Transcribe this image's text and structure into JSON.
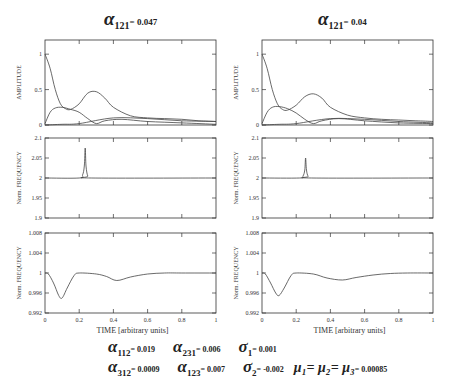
{
  "panels": [
    {
      "title": {
        "symbol": "α",
        "subscript": "121",
        "value": "= 0.047"
      },
      "left": 45
    },
    {
      "title": {
        "symbol": "α",
        "subscript": "121",
        "value": "= 0.04"
      },
      "left": 262
    }
  ],
  "axes_labels": {
    "amplitude": "AMPLITUDE",
    "frequency": "Norm. FREQUENCY",
    "time": "TIME [arbitrary units]"
  },
  "parameters": {
    "row1": [
      {
        "symbol": "α",
        "subscript": "112",
        "value": "= 0.019"
      },
      {
        "symbol": "α",
        "subscript": "231",
        "value": "= 0.006"
      },
      {
        "symbol": "σ",
        "subscript": "1",
        "value": "= 0.001"
      }
    ],
    "row2": [
      {
        "symbol": "α",
        "subscript": "312",
        "value": "= 0.0009"
      },
      {
        "symbol": "α",
        "subscript": "123",
        "value": "= 0.007"
      },
      {
        "symbol": "σ",
        "subscript": "2",
        "value": "= -0.002"
      },
      {
        "symbol": "μ₁= μ₂= μ₃",
        "subscript": "",
        "value": "= 0.00085"
      }
    ]
  },
  "chart_data": [
    {
      "type": "line",
      "panel": "left",
      "title": "α121 = 0.047",
      "xlabel": "",
      "ylabel": "AMPLITUDE",
      "xlim": [
        0,
        1
      ],
      "ylim": [
        0,
        1.2
      ],
      "yticks": [
        "0",
        "0.5",
        "1"
      ],
      "series": [
        {
          "name": "mode 1",
          "x": [
            0,
            0.03,
            0.06,
            0.09,
            0.12,
            0.15,
            0.2,
            0.25,
            0.3,
            0.35,
            0.4,
            0.5,
            0.6,
            0.7,
            0.8,
            0.9,
            1.0
          ],
          "values": [
            1.0,
            0.8,
            0.5,
            0.3,
            0.23,
            0.22,
            0.3,
            0.45,
            0.47,
            0.38,
            0.25,
            0.13,
            0.1,
            0.09,
            0.08,
            0.06,
            0.05
          ]
        },
        {
          "name": "mode 2",
          "x": [
            0,
            0.03,
            0.06,
            0.1,
            0.15,
            0.2,
            0.25,
            0.3,
            0.35,
            0.45,
            0.6,
            0.8,
            1.0
          ],
          "values": [
            0.02,
            0.18,
            0.24,
            0.25,
            0.22,
            0.18,
            0.09,
            0.02,
            0.06,
            0.08,
            0.05,
            0.03,
            0.01
          ]
        },
        {
          "name": "mode 3",
          "x": [
            0,
            0.1,
            0.2,
            0.4,
            0.6,
            0.8,
            1.0
          ],
          "values": [
            0.0,
            0.01,
            0.02,
            0.1,
            0.09,
            0.06,
            0.05
          ]
        }
      ]
    },
    {
      "type": "line",
      "panel": "left",
      "xlabel": "",
      "ylabel": "Norm. FREQUENCY",
      "xlim": [
        0,
        1
      ],
      "ylim": [
        1.9,
        2.1
      ],
      "yticks": [
        "1.9",
        "1.95",
        "2",
        "2.05",
        "2.1"
      ],
      "series": [
        {
          "name": "frequency",
          "x": [
            0,
            0.2,
            0.22,
            0.23,
            0.235,
            0.24,
            0.25,
            0.27,
            1.0
          ],
          "values": [
            2.0,
            2.0,
            2.008,
            2.03,
            2.075,
            2.03,
            2.005,
            2.0,
            2.0
          ]
        }
      ]
    },
    {
      "type": "line",
      "panel": "left",
      "xlabel": "TIME [arbitrary units]",
      "ylabel": "Norm. FREQUENCY",
      "xlim": [
        0,
        1
      ],
      "ylim": [
        0.992,
        1.008
      ],
      "xticks": [
        "0",
        "0.2",
        "0.4",
        "0.6",
        "0.8",
        "1"
      ],
      "yticks": [
        "0.992",
        "0.996",
        "1",
        "1.004",
        "1.008"
      ],
      "series": [
        {
          "name": "frequency",
          "x": [
            0,
            0.02,
            0.05,
            0.08,
            0.1,
            0.13,
            0.17,
            0.2,
            0.3,
            0.36,
            0.42,
            0.5,
            0.6,
            0.7,
            0.8,
            1.0
          ],
          "values": [
            1.0,
            0.9998,
            0.998,
            0.9955,
            0.995,
            0.997,
            0.9995,
            1.0,
            0.9998,
            0.9993,
            0.9985,
            0.9992,
            0.9998,
            1.0,
            1.0,
            1.0
          ]
        }
      ]
    },
    {
      "type": "line",
      "panel": "right",
      "title": "α121 = 0.04",
      "xlabel": "",
      "ylabel": "AMPLITUDE",
      "xlim": [
        0,
        1
      ],
      "ylim": [
        0,
        1.2
      ],
      "yticks": [
        "0",
        "0.5",
        "1"
      ],
      "series": [
        {
          "name": "mode 1",
          "x": [
            0,
            0.03,
            0.06,
            0.09,
            0.12,
            0.15,
            0.2,
            0.25,
            0.3,
            0.35,
            0.4,
            0.5,
            0.6,
            0.7,
            0.8,
            0.9,
            1.0
          ],
          "values": [
            1.0,
            0.8,
            0.5,
            0.3,
            0.22,
            0.21,
            0.28,
            0.4,
            0.44,
            0.38,
            0.25,
            0.14,
            0.1,
            0.08,
            0.07,
            0.06,
            0.05
          ]
        },
        {
          "name": "mode 2",
          "x": [
            0,
            0.03,
            0.06,
            0.1,
            0.15,
            0.2,
            0.25,
            0.3,
            0.35,
            0.45,
            0.6,
            0.8,
            1.0
          ],
          "values": [
            0.02,
            0.18,
            0.25,
            0.26,
            0.23,
            0.17,
            0.08,
            0.02,
            0.06,
            0.09,
            0.06,
            0.03,
            0.02
          ]
        },
        {
          "name": "mode 3",
          "x": [
            0,
            0.1,
            0.2,
            0.4,
            0.6,
            0.8,
            1.0
          ],
          "values": [
            0.0,
            0.01,
            0.02,
            0.09,
            0.08,
            0.05,
            0.03
          ]
        }
      ]
    },
    {
      "type": "line",
      "panel": "right",
      "xlabel": "",
      "ylabel": "Norm. FREQUENCY",
      "xlim": [
        0,
        1
      ],
      "ylim": [
        1.9,
        2.1
      ],
      "yticks": [
        "1.9",
        "1.95",
        "2",
        "2.05",
        "2.1"
      ],
      "series": [
        {
          "name": "frequency",
          "x": [
            0,
            0.22,
            0.24,
            0.25,
            0.255,
            0.26,
            0.27,
            0.29,
            1.0
          ],
          "values": [
            2.0,
            2.0,
            2.005,
            2.02,
            2.05,
            2.02,
            2.004,
            2.0,
            2.0
          ]
        }
      ]
    },
    {
      "type": "line",
      "panel": "right",
      "xlabel": "TIME [arbitrary units]",
      "ylabel": "Norm. FREQUENCY",
      "xlim": [
        0,
        1
      ],
      "ylim": [
        0.992,
        1.008
      ],
      "xticks": [
        "0",
        "0.2",
        "0.4",
        "0.6",
        "0.8",
        "1"
      ],
      "yticks": [
        "0.992",
        "0.996",
        "1",
        "1.004",
        "1.008"
      ],
      "series": [
        {
          "name": "frequency",
          "x": [
            0,
            0.02,
            0.05,
            0.08,
            0.1,
            0.13,
            0.17,
            0.2,
            0.3,
            0.38,
            0.47,
            0.55,
            0.65,
            0.75,
            0.85,
            1.0
          ],
          "values": [
            1.0,
            0.9998,
            0.998,
            0.996,
            0.9955,
            0.997,
            0.9995,
            1.0,
            0.9998,
            0.999,
            0.9986,
            0.9991,
            0.9996,
            0.9999,
            1.0,
            1.0
          ]
        }
      ]
    }
  ]
}
